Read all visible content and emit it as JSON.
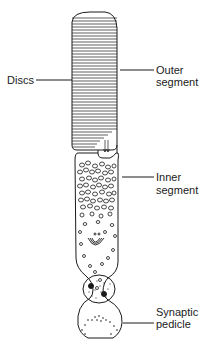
{
  "diagram": {
    "labels": {
      "discs": "Discs",
      "outer_segment_1": "Outer",
      "outer_segment_2": "segment",
      "inner_segment_1": "Inner",
      "inner_segment_2": "segment",
      "synaptic_pedicle_1": "Synaptic",
      "synaptic_pedicle_2": "pedicle"
    },
    "colors": {
      "ink": "#1a1a1a",
      "background": "#ffffff"
    }
  }
}
